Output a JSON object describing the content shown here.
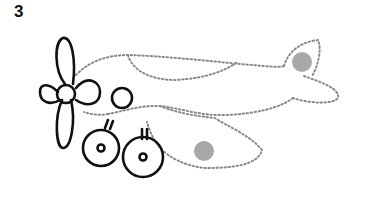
{
  "worksheet": {
    "number": "3",
    "subject": "airplane tracing",
    "colors": {
      "outline": "#111111",
      "dotted_trace": "#8a8a8a",
      "dot_fill": "#a8a8a8",
      "background": "#ffffff"
    }
  }
}
